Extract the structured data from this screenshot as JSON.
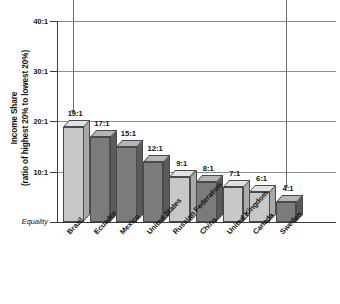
{
  "chart_data": {
    "type": "bar",
    "title": "",
    "xlabel": "",
    "ylabel": "Income Share (ratio of highest 20% to lowest 20%)",
    "ylabel_line1": "Income Share",
    "ylabel_line2": "(ratio of highest 20% to lowest 20%)",
    "ylim": [
      0,
      40
    ],
    "grid": true,
    "legend": "none",
    "categories": [
      "Brazil",
      "Ecuador",
      "Mexico",
      "United States",
      "Russian Federation",
      "China",
      "United Kingdom",
      "Canada",
      "Sweden"
    ],
    "values": [
      19,
      17,
      15,
      12,
      9,
      8,
      7,
      6,
      4
    ],
    "data_labels": [
      "19:1",
      "17:1",
      "15:1",
      "12:1",
      "9:1",
      "8:1",
      "7:1",
      "6:1",
      "4:1"
    ],
    "bar_shades": [
      "light",
      "dark",
      "dark",
      "dark",
      "light",
      "dark",
      "light",
      "light",
      "dark"
    ],
    "ytick_values": [
      40,
      30,
      20,
      10,
      0
    ],
    "ytick_labels": [
      "40:1",
      "30:1",
      "20:1",
      "10:1",
      "Equality"
    ],
    "baseline_label": "Equality",
    "annotations": [
      {
        "target": "Brazil",
        "label": ""
      },
      {
        "target": "Sweden",
        "label": ""
      }
    ]
  },
  "colors": {
    "bar_light_face": "#c8c8c8",
    "bar_light_top": "#e2e2e2",
    "bar_light_side": "#a9a9a9",
    "bar_dark_face": "#7b7b7b",
    "bar_dark_top": "#b4b4b4",
    "bar_dark_side": "#5a5a5a",
    "axis": "#3b3b3b",
    "grid": "#8d8d8d",
    "text": "#111111",
    "background": "#ffffff"
  },
  "top_caption": ""
}
